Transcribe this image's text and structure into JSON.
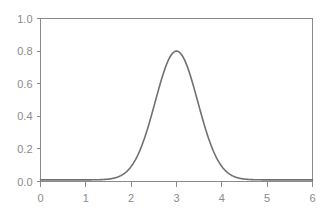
{
  "chart_data": {
    "type": "line",
    "title": "",
    "subtitle": "",
    "xlabel": "",
    "ylabel": "",
    "xlim": [
      0,
      6
    ],
    "ylim": [
      0.0,
      1.0
    ],
    "grid": false,
    "legend": null,
    "annotations": [],
    "x_ticks": [
      "0",
      "1",
      "2",
      "3",
      "4",
      "5",
      "6"
    ],
    "x_tick_values": [
      0,
      1,
      2,
      3,
      4,
      5,
      6
    ],
    "y_ticks": [
      "0.0",
      "0.2",
      "0.4",
      "0.6",
      "0.8",
      "1.0"
    ],
    "y_tick_values": [
      0.0,
      0.2,
      0.4,
      0.6,
      0.8,
      1.0
    ],
    "series": [
      {
        "name": "gaussian",
        "color": "#707070",
        "peak_x": 3.0,
        "peak_y": 0.8,
        "sigma": 0.47,
        "baseline": 0.01,
        "x": [
          0.0,
          0.2,
          0.4,
          0.6,
          0.8,
          1.0,
          1.2,
          1.4,
          1.6,
          1.8,
          2.0,
          2.2,
          2.4,
          2.6,
          2.8,
          3.0,
          3.2,
          3.4,
          3.6,
          3.8,
          4.0,
          4.2,
          4.4,
          4.6,
          4.8,
          5.0,
          5.2,
          5.4,
          5.6,
          5.8,
          6.0
        ],
        "y": [
          0.01,
          0.01,
          0.01,
          0.01,
          0.01,
          0.011,
          0.014,
          0.024,
          0.053,
          0.115,
          0.216,
          0.357,
          0.518,
          0.663,
          0.763,
          0.81,
          0.763,
          0.663,
          0.518,
          0.357,
          0.216,
          0.115,
          0.053,
          0.024,
          0.014,
          0.011,
          0.01,
          0.01,
          0.01,
          0.01,
          0.01
        ]
      }
    ]
  },
  "colors": {
    "curve": "#707070",
    "axis": "#8a8a8a",
    "tick_label": "#8a8a8a",
    "background": "#ffffff"
  }
}
